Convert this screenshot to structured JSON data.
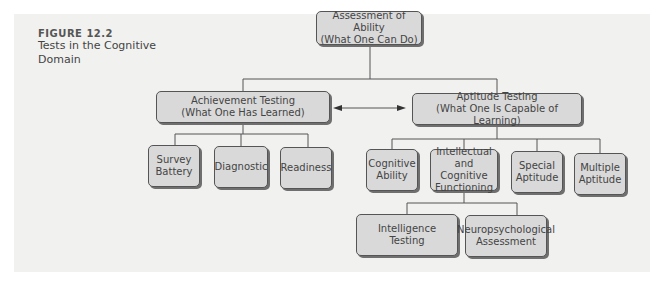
{
  "figure": {
    "number": "FIGURE 12.2",
    "title": "Tests in the Cognitive Domain"
  },
  "nodes": {
    "root": {
      "line1": "Assessment of Ability",
      "line2": "(What One Can Do)"
    },
    "achievement": {
      "line1": "Achievement Testing",
      "line2": "(What One Has Learned)"
    },
    "aptitude": {
      "line1": "Aptitude Testing",
      "line2": "(What One Is Capable of Learning)"
    },
    "survey": {
      "line1": "Survey",
      "line2": "Battery"
    },
    "diagnostic": {
      "line1": "Diagnostic"
    },
    "readiness": {
      "line1": "Readiness"
    },
    "cognitive_ability": {
      "line1": "Cognitive",
      "line2": "Ability"
    },
    "intellectual": {
      "line1": "Intellectual",
      "line2": "and Cognitive",
      "line3": "Functioning"
    },
    "special": {
      "line1": "Special",
      "line2": "Aptitude"
    },
    "multiple": {
      "line1": "Multiple",
      "line2": "Aptitude"
    },
    "intelligence": {
      "line1": "Intelligence",
      "line2": "Testing"
    },
    "neuro": {
      "line1": "Neuropsychological",
      "line2": "Assessment"
    }
  },
  "colors": {
    "panel": "#f1f1f0",
    "box_fill": "#d9d9d9",
    "box_border": "#555555",
    "line": "#555555"
  }
}
